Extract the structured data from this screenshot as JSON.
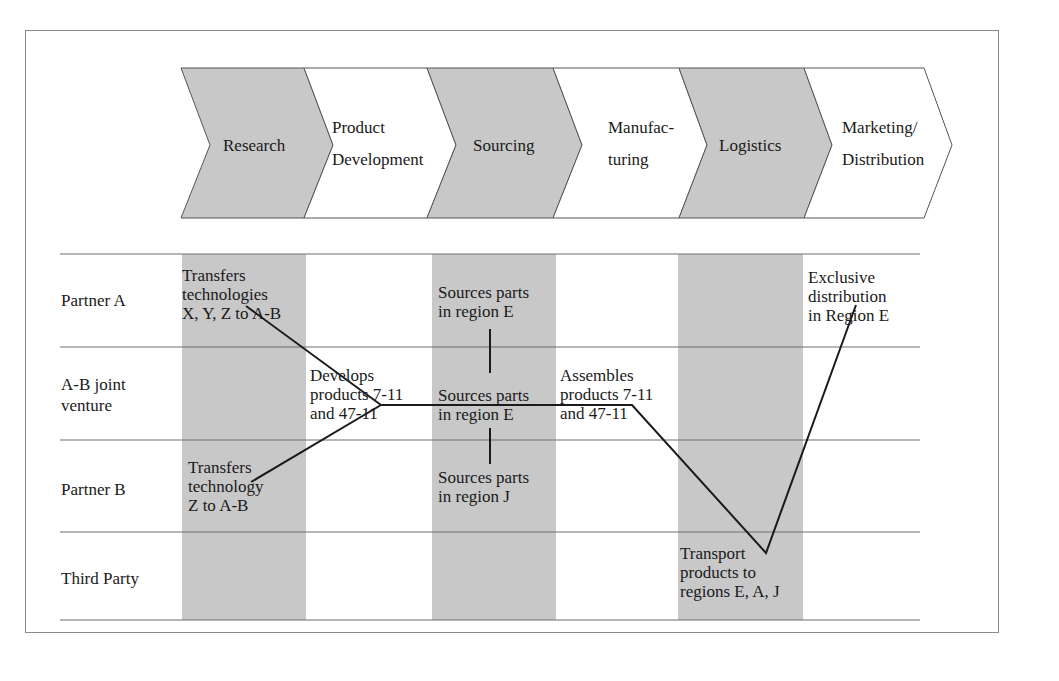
{
  "colors": {
    "shade": "#c8c8c8",
    "line": "#1a1a1a",
    "rule": "#6f6f6f",
    "frame": "#8a8a8a"
  },
  "value_chain": {
    "stages": [
      {
        "label": "Research",
        "shaded": true
      },
      {
        "label_line1": "Product",
        "label_line2": "Development",
        "shaded": false
      },
      {
        "label": "Sourcing",
        "shaded": true
      },
      {
        "label_line1": "Manufac-",
        "label_line2": "turing",
        "shaded": false
      },
      {
        "label": "Logistics",
        "shaded": true
      },
      {
        "label_line1": "Marketing/",
        "label_line2": "Distribution",
        "shaded": false
      }
    ]
  },
  "rows": [
    {
      "label_line1": "Partner A"
    },
    {
      "label_line1": "A-B joint",
      "label_line2": "venture"
    },
    {
      "label_line1": "Partner B"
    },
    {
      "label_line1": "Third Party"
    }
  ],
  "activities": {
    "partner_a_research": [
      "Transfers",
      "technologies",
      "X, Y, Z to A-B"
    ],
    "partner_a_sourcing": [
      "Sources parts",
      "in region E"
    ],
    "partner_a_marketing": [
      "Exclusive",
      "distribution",
      "in Region E"
    ],
    "jv_product_dev": [
      "Develops",
      "products 7-11",
      "and 47-11"
    ],
    "jv_sourcing": [
      "Sources parts",
      "in region E"
    ],
    "jv_manufacturing": [
      "Assembles",
      "products 7-11",
      "and 47-11"
    ],
    "partner_b_research": [
      "Transfers",
      "technology",
      "Z to A-B"
    ],
    "partner_b_sourcing": [
      "Sources parts",
      "in region J"
    ],
    "third_party_logistics": [
      "Transport",
      "products to",
      "regions E, A, J"
    ]
  }
}
